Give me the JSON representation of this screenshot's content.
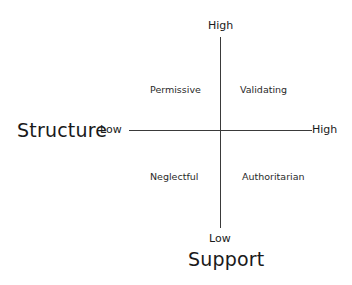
{
  "diagram": {
    "type": "2x2-quadrant",
    "x_axis": {
      "title": "Structure",
      "low_label": "Low",
      "high_label": "High"
    },
    "y_axis": {
      "title": "Support",
      "low_label": "Low",
      "high_label": "High"
    },
    "quadrants": {
      "top_left": "Permissive",
      "top_right": "Validating",
      "bottom_left": "Neglectful",
      "bottom_right": "Authoritarian"
    }
  }
}
